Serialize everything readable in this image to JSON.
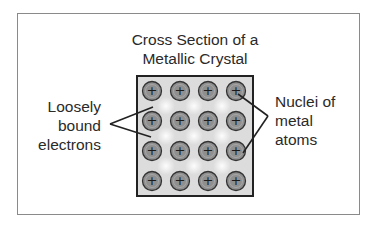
{
  "figure": {
    "title_lines": [
      "Cross Section of a",
      "Metallic Crystal"
    ],
    "left_label_lines": [
      "Loosely",
      "bound",
      "electrons"
    ],
    "right_label_lines": [
      "Nuclei of",
      "metal",
      "atoms"
    ],
    "nucleus_symbol": "+",
    "grid": {
      "rows": 4,
      "cols": 4
    },
    "colors": {
      "frame": "#8a8a8a",
      "crystal_border": "#222222",
      "crystal_fill": "#dcdcdc",
      "nucleus_fill": "#8f8f8f",
      "nucleus_stroke": "#333333",
      "pointer_line": "#222222"
    }
  }
}
